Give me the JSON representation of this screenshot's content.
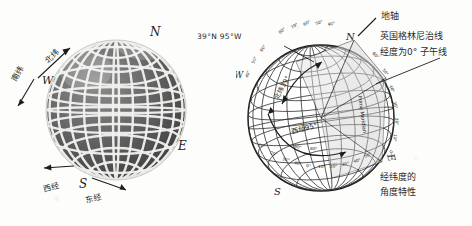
{
  "figure": {
    "title_caption": "经纬度的 角度特性",
    "background_color": "#fdfdfb",
    "ink_color": "#1d1d1d"
  },
  "left_globe": {
    "name": "latitude-longitude-direction-globe",
    "cardinals": {
      "north": "N",
      "south": "S",
      "east": "E",
      "west": "W"
    },
    "labels": {
      "north_latitude": "北纬",
      "south_latitude": "南纬",
      "west_longitude": "西经",
      "east_longitude": "东经"
    }
  },
  "right_globe": {
    "name": "angular-coordinates-globe",
    "cardinals": {
      "north": "N",
      "south": "S",
      "east": "E",
      "west": "W"
    },
    "axis_label": "地轴",
    "coordinate_label": "39°N 95°W",
    "greenwich_callout_line1": "英国格林尼治线",
    "greenwich_callout_line2": "经度为0° 子午线",
    "prime_meridian_label": "Prime Meridian",
    "latitude_arc_label": "北纬39°",
    "longitude_arc_label": "西经95°",
    "caption_line1": "经纬度的",
    "caption_line2": "角度特性",
    "meridian_ticks": [
      "0°",
      "10°",
      "20°",
      "30°",
      "40°",
      "50°",
      "60°",
      "70°",
      "80°"
    ],
    "equator_ticks": [
      "0°",
      "10°",
      "20°",
      "30°",
      "40°",
      "50°",
      "60°",
      "70°",
      "80°",
      "90°"
    ]
  }
}
